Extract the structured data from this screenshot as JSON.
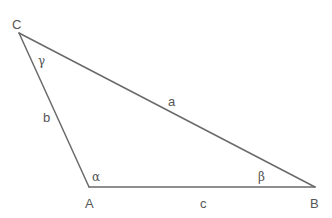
{
  "diagram": {
    "type": "triangle",
    "line_color": "#6a6a6a",
    "text_color": "#555555",
    "vertices": [
      {
        "id": "A",
        "label": "A",
        "x": 89,
        "y": 187,
        "label_x": 85,
        "label_y": 208
      },
      {
        "id": "B",
        "label": "B",
        "x": 315,
        "y": 187,
        "label_x": 310,
        "label_y": 208
      },
      {
        "id": "C",
        "label": "C",
        "x": 19,
        "y": 33,
        "label_x": 12,
        "label_y": 29
      }
    ],
    "sides": [
      {
        "id": "a",
        "label": "a",
        "from": "B",
        "to": "C",
        "label_x": 168,
        "label_y": 106
      },
      {
        "id": "b",
        "label": "b",
        "from": "C",
        "to": "A",
        "label_x": 43,
        "label_y": 122
      },
      {
        "id": "c",
        "label": "c",
        "from": "A",
        "to": "B",
        "label_x": 200,
        "label_y": 208
      }
    ],
    "angles": [
      {
        "id": "alpha",
        "label": "α",
        "vertex": "A",
        "label_x": 92,
        "label_y": 181
      },
      {
        "id": "beta",
        "label": "β",
        "vertex": "B",
        "label_x": 258,
        "label_y": 181
      },
      {
        "id": "gamma",
        "label": "γ",
        "vertex": "C",
        "label_x": 38,
        "label_y": 65
      }
    ]
  }
}
